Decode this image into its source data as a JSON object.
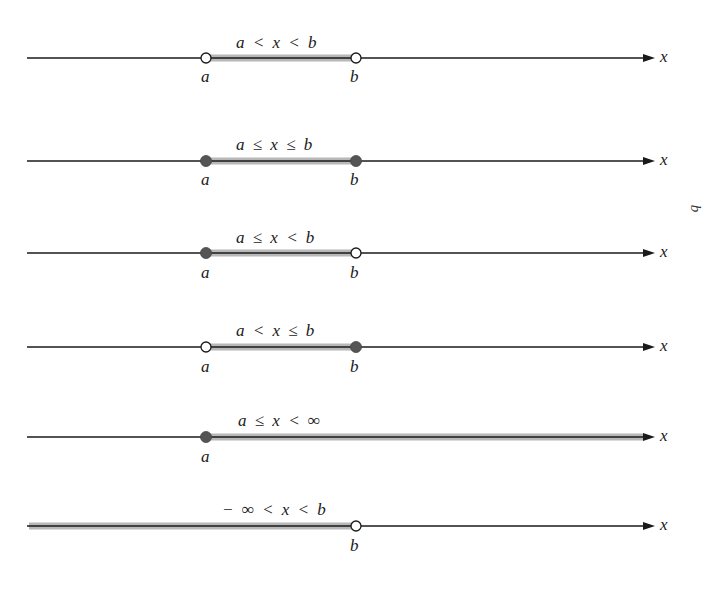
{
  "figure": {
    "axis_label": "x",
    "side_label": "b",
    "colors": {
      "line": "#1a1a1a",
      "shade": "#b8b8b8",
      "closed_dot": "#555555",
      "open_dot_fill": "#ffffff"
    },
    "axis": {
      "x_start": 27,
      "x_end": 655,
      "a_x": 206,
      "b_x": 356
    },
    "intervals": [
      {
        "id": "open",
        "notation": "a < x < b",
        "y": 58,
        "left": {
          "label": "a",
          "type": "open"
        },
        "right": {
          "label": "b",
          "type": "open"
        },
        "shade_from": "a",
        "shade_to": "b"
      },
      {
        "id": "closed",
        "notation": "a ≤ x ≤ b",
        "y": 161,
        "left": {
          "label": "a",
          "type": "closed"
        },
        "right": {
          "label": "b",
          "type": "closed"
        },
        "shade_from": "a",
        "shade_to": "b"
      },
      {
        "id": "half-open-right",
        "notation": "a ≤ x < b",
        "y": 253,
        "left": {
          "label": "a",
          "type": "closed"
        },
        "right": {
          "label": "b",
          "type": "open"
        },
        "shade_from": "a",
        "shade_to": "b"
      },
      {
        "id": "half-open-left",
        "notation": "a < x ≤ b",
        "y": 347,
        "left": {
          "label": "a",
          "type": "open"
        },
        "right": {
          "label": "b",
          "type": "closed"
        },
        "shade_from": "a",
        "shade_to": "b"
      },
      {
        "id": "ray-right",
        "notation": "a ≤ x < ∞",
        "y": 437,
        "left": {
          "label": "a",
          "type": "closed"
        },
        "right": null,
        "shade_from": "a",
        "shade_to": "end"
      },
      {
        "id": "ray-left",
        "notation": "− ∞ < x < b",
        "y": 526,
        "left": null,
        "right": {
          "label": "b",
          "type": "open"
        },
        "shade_from": "start",
        "shade_to": "b"
      }
    ]
  }
}
